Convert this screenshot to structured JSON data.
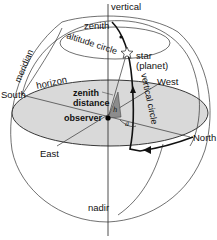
{
  "diagram": {
    "colors": {
      "horizon_plane": "#d9d9d9",
      "zenith_triangle": "#8c8c8c",
      "line": "#333333",
      "background": "#ffffff"
    },
    "labels": {
      "vertical": "vertical",
      "zenith": "zenith",
      "altitude_circle": "altitude circle",
      "meridian": "meridian",
      "star": "star",
      "planet": "(planet)",
      "horizon": "horizon",
      "south": "South",
      "west": "West",
      "zenith_distance_1": "zenith",
      "zenith_distance_2": "distance",
      "vertical_circle": "vertical circle",
      "observer": "observer",
      "east": "East",
      "north": "North",
      "nadir": "nadir",
      "h_angle": "h",
      "a_angle": "a"
    }
  }
}
